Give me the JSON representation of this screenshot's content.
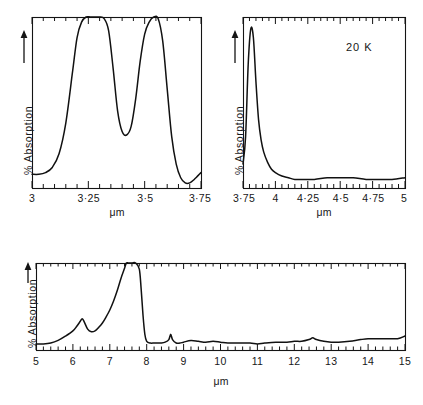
{
  "figure": {
    "background": "#ffffff",
    "ink": "#111111",
    "axis_title": "μm",
    "y_axis_label": "% Absorption",
    "y_axis_arrow": "up-arrow"
  },
  "annotations": {
    "temperature": "20 K"
  },
  "chart_data": [
    {
      "type": "line",
      "panel": "top-left",
      "title": "",
      "xlabel": "μm",
      "ylabel": "% Absorption",
      "xlim": [
        3.0,
        3.75
      ],
      "ylim": [
        0,
        100
      ],
      "grid": false,
      "legend": "none",
      "xticks_major": [
        3,
        3.25,
        3.5,
        3.75
      ],
      "xticklabels": [
        "3",
        "3·25",
        "3·5",
        "3·75"
      ],
      "xticks_minor_step": 0.05,
      "yticks": [],
      "series": [
        {
          "name": "absorption",
          "x": [
            3.0,
            3.03,
            3.06,
            3.09,
            3.12,
            3.15,
            3.18,
            3.2,
            3.22,
            3.24,
            3.26,
            3.28,
            3.3,
            3.32,
            3.34,
            3.36,
            3.38,
            3.4,
            3.42,
            3.44,
            3.46,
            3.48,
            3.5,
            3.52,
            3.54,
            3.56,
            3.58,
            3.6,
            3.62,
            3.64,
            3.66,
            3.68,
            3.7,
            3.72,
            3.75
          ],
          "y": [
            8,
            8,
            9,
            12,
            20,
            38,
            68,
            88,
            97,
            100,
            100,
            100,
            100,
            99,
            92,
            70,
            45,
            33,
            31,
            36,
            52,
            74,
            90,
            97,
            100,
            99,
            86,
            58,
            30,
            14,
            6,
            3,
            3,
            5,
            9
          ]
        }
      ]
    },
    {
      "type": "line",
      "panel": "top-right",
      "title": "",
      "xlabel": "μm",
      "ylabel": "% Absorption",
      "xlim": [
        3.75,
        5.0
      ],
      "ylim": [
        0,
        100
      ],
      "grid": false,
      "legend": "none",
      "xticks_major": [
        3.75,
        4.0,
        4.25,
        4.5,
        4.75,
        5.0
      ],
      "xticklabels": [
        "3·75",
        "4",
        "4·25",
        "4·5",
        "4·75",
        "5"
      ],
      "xticks_minor_step": 0.05,
      "yticks": [],
      "annotation_text": "20 K",
      "series": [
        {
          "name": "absorption",
          "x": [
            3.75,
            3.77,
            3.79,
            3.81,
            3.83,
            3.85,
            3.87,
            3.89,
            3.91,
            3.94,
            3.97,
            4.0,
            4.05,
            4.1,
            4.15,
            4.2,
            4.3,
            4.4,
            4.5,
            4.6,
            4.7,
            4.8,
            4.9,
            5.0
          ],
          "y": [
            14,
            30,
            72,
            93,
            88,
            62,
            40,
            28,
            21,
            15,
            11,
            9,
            7,
            6,
            5,
            5,
            5,
            6,
            6,
            6,
            5,
            5,
            5,
            6
          ]
        }
      ]
    },
    {
      "type": "line",
      "panel": "bottom",
      "title": "",
      "xlabel": "μm",
      "ylabel": "% Absorption",
      "xlim": [
        5,
        15
      ],
      "ylim": [
        0,
        100
      ],
      "grid": false,
      "legend": "none",
      "xticks_major": [
        5,
        6,
        7,
        8,
        9,
        10,
        11,
        12,
        13,
        14,
        15
      ],
      "xticklabels": [
        "5",
        "6",
        "7",
        "8",
        "9",
        "10",
        "11",
        "12",
        "13",
        "14",
        "15"
      ],
      "xticks_minor_step": 0.2,
      "yticks": [],
      "series": [
        {
          "name": "absorption",
          "x": [
            5.0,
            5.2,
            5.4,
            5.6,
            5.8,
            6.0,
            6.1,
            6.2,
            6.25,
            6.3,
            6.4,
            6.5,
            6.6,
            6.7,
            6.8,
            6.9,
            7.0,
            7.1,
            7.2,
            7.3,
            7.4,
            7.45,
            7.5,
            7.6,
            7.7,
            7.8,
            7.85,
            7.9,
            7.95,
            8.0,
            8.1,
            8.2,
            8.3,
            8.4,
            8.5,
            8.6,
            8.65,
            8.7,
            8.8,
            8.9,
            9.0,
            9.2,
            9.4,
            9.6,
            9.8,
            10.0,
            10.2,
            10.5,
            10.8,
            11.0,
            11.2,
            11.5,
            11.8,
            12.0,
            12.2,
            12.4,
            12.5,
            12.6,
            12.8,
            13.0,
            13.2,
            13.5,
            13.8,
            14.0,
            14.2,
            14.5,
            14.8,
            15.0
          ],
          "y": [
            7,
            7,
            8,
            11,
            16,
            22,
            27,
            33,
            36,
            33,
            24,
            21,
            22,
            26,
            31,
            38,
            46,
            56,
            68,
            82,
            94,
            100,
            100,
            100,
            100,
            93,
            70,
            40,
            18,
            10,
            8,
            8,
            8,
            8,
            9,
            12,
            18,
            12,
            8,
            8,
            9,
            11,
            10,
            9,
            10,
            9,
            8,
            8,
            8,
            7,
            8,
            9,
            9,
            10,
            10,
            12,
            14,
            12,
            10,
            9,
            9,
            10,
            12,
            13,
            13,
            13,
            13,
            16
          ]
        }
      ]
    }
  ]
}
